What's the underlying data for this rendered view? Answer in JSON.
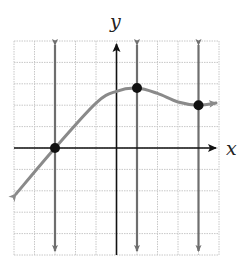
{
  "chart_data": {
    "type": "line",
    "title": "",
    "xlabel": "x",
    "ylabel": "y",
    "xlim": [
      -5,
      5
    ],
    "ylim": [
      -5,
      5
    ],
    "grid": true,
    "curve": {
      "description": "Smooth curve rising from lower left, crossing x-axis at x=-3, reaching a local maximum near (1, 2.8), dipping to a local minimum near (4, 2), with arrows at both ends",
      "points": [
        [
          -5,
          -2
        ],
        [
          -3,
          0
        ],
        [
          -1,
          2.1
        ],
        [
          0,
          2.65
        ],
        [
          1,
          2.8
        ],
        [
          2,
          2.55
        ],
        [
          3,
          2.15
        ],
        [
          4,
          2
        ],
        [
          5,
          2.1
        ]
      ],
      "color": "#808080"
    },
    "marked_points": [
      [
        -3,
        0
      ],
      [
        1,
        2.8
      ],
      [
        4,
        2
      ]
    ],
    "vertical_lines": [
      {
        "x": -3,
        "color": "#6e6e6e"
      },
      {
        "x": 1,
        "color": "#6e6e6e"
      },
      {
        "x": 4,
        "color": "#6e6e6e"
      }
    ]
  },
  "labels": {
    "x_axis": "x",
    "y_axis": "y"
  },
  "colors": {
    "grid": "#c8c8c8",
    "axis": "#111111",
    "curve": "#8a8a8a",
    "vline": "#707070",
    "point": "#111111"
  }
}
